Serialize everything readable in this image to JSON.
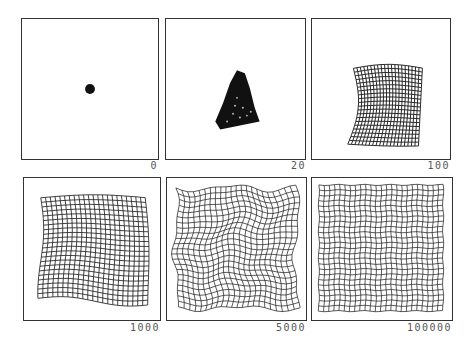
{
  "figure": {
    "panels": [
      {
        "label": "0",
        "state": "collapsed-point"
      },
      {
        "label": "20",
        "state": "small-tangled-cluster"
      },
      {
        "label": "100",
        "state": "partially-unfolded-grid"
      },
      {
        "label": "1000",
        "state": "mostly-unfolded-grid"
      },
      {
        "label": "5000",
        "state": "wavy-full-grid"
      },
      {
        "label": "100000",
        "state": "regular-full-grid"
      }
    ],
    "colors": {
      "ink": "#111111",
      "frame": "#333333",
      "label": "#555555",
      "background": "#ffffff"
    }
  }
}
